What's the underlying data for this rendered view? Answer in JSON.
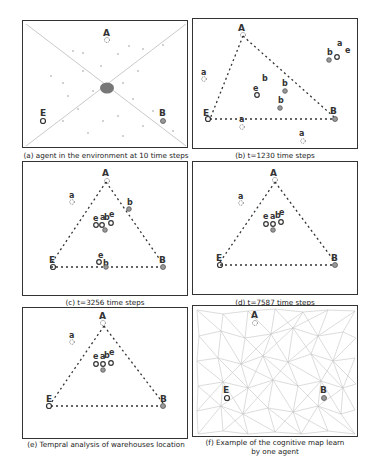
{
  "figure": {
    "panels": [
      {
        "id": "a",
        "caption": "(a) agent in the environment at 10 time steps"
      },
      {
        "id": "b",
        "caption": "(b) t=1230 time steps"
      },
      {
        "id": "c",
        "caption": "(c) t=3256 time steps"
      },
      {
        "id": "d",
        "caption": "(d) t=7587 time steps"
      },
      {
        "id": "e",
        "caption": "(e) Tempral analysis of warehouses location"
      },
      {
        "id": "f",
        "caption_line1": "(f) Example of the cognitive map learn",
        "caption_line2": "by one agent"
      }
    ],
    "labels": {
      "A": "A",
      "B": "B",
      "E": "E",
      "a": "a",
      "b": "b",
      "e": "e"
    },
    "legend_symbols": {
      "A": "dashed-circle (warehouse A)",
      "B": "gray-filled-circle (warehouse B)",
      "E": "open-circle (warehouse E)"
    }
  }
}
